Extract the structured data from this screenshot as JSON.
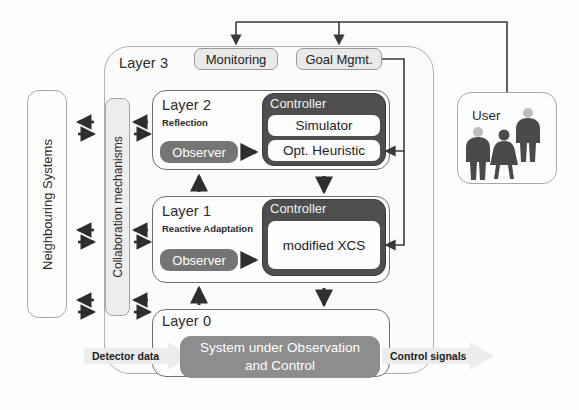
{
  "diagram": {
    "colors": {
      "controller_fill": "#4e4e4e",
      "observer_fill": "#757575",
      "system_fill": "#8d8d8d",
      "chip_fill": "#e9e9e9",
      "collab_fill": "#ededed",
      "outline": "#6f6f6f",
      "arrow": "#3a3a3a"
    }
  },
  "neighbouring": {
    "label": "Neighbouring Systems"
  },
  "collaboration": {
    "label": "Collaboration mechanisms"
  },
  "layer3": {
    "title": "Layer 3",
    "monitoring": "Monitoring",
    "goal_mgmt": "Goal Mgmt."
  },
  "layer2": {
    "title": "Layer 2",
    "subtitle": "Reflection",
    "observer": "Observer",
    "controller": "Controller",
    "simulator": "Simulator",
    "opt_heuristic": "Opt. Heuristic"
  },
  "layer1": {
    "title": "Layer 1",
    "subtitle": "Reactive Adaptation",
    "observer": "Observer",
    "controller": "Controller",
    "xcs": "modified XCS"
  },
  "layer0": {
    "title": "Layer 0",
    "system": "System under Observation and Control",
    "system_line1": "System under Observation",
    "system_line2": "and Control",
    "detector_data": "Detector data",
    "control_signals": "Control signals"
  },
  "user": {
    "title": "User",
    "figures": [
      "person-suit-icon",
      "person-dress-icon",
      "person-suit-icon"
    ]
  }
}
